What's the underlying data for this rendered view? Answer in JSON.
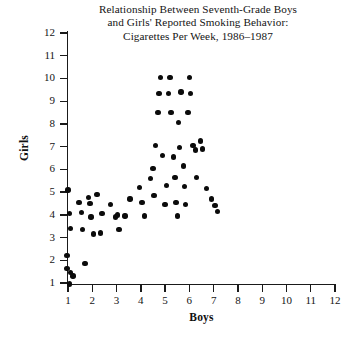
{
  "chart_data": {
    "type": "scatter",
    "title": "Relationship Between Seventh-Grade Boys and Girls' Reported Smoking Behavior: Cigarettes Per Week, 1986–1987",
    "title_lines": [
      "Relationship Between Seventh-Grade Boys",
      "and Girls' Reported Smoking Behavior:",
      "Cigarettes Per Week, 1986–1987"
    ],
    "xlabel": "Boys",
    "ylabel": "Girls",
    "xlim": [
      0.55,
      12.0
    ],
    "ylim": [
      0.45,
      12.0
    ],
    "xticks": [
      1,
      2,
      3,
      4,
      5,
      6,
      7,
      8,
      9,
      10,
      11,
      12
    ],
    "yticks": [
      1,
      2,
      3,
      4,
      5,
      6,
      7,
      8,
      9,
      10,
      11,
      12
    ],
    "xtick_labels": [
      "1",
      "2",
      "3",
      "4",
      "5",
      "6",
      "7",
      "8",
      "9",
      "10",
      "11",
      "12"
    ],
    "ytick_labels": [
      "1",
      "2",
      "3",
      "4",
      "5",
      "6",
      "7",
      "8",
      "9",
      "10",
      "11",
      "12"
    ],
    "grid": false,
    "legend": null,
    "marker": "filled-circle",
    "marker_color": "#0b0b0b",
    "n_points": 63,
    "points": [
      [
        1.0,
        5.1
      ],
      [
        1.05,
        4.05
      ],
      [
        1.1,
        3.4
      ],
      [
        0.95,
        2.2
      ],
      [
        0.95,
        1.65
      ],
      [
        1.1,
        1.45
      ],
      [
        1.2,
        1.3
      ],
      [
        1.05,
        0.95
      ],
      [
        1.45,
        4.55
      ],
      [
        1.55,
        4.1
      ],
      [
        1.6,
        3.35
      ],
      [
        1.7,
        1.85
      ],
      [
        1.85,
        4.75
      ],
      [
        1.9,
        4.5
      ],
      [
        1.95,
        3.9
      ],
      [
        2.05,
        3.15
      ],
      [
        2.2,
        4.9
      ],
      [
        2.35,
        3.2
      ],
      [
        2.4,
        4.05
      ],
      [
        2.75,
        4.45
      ],
      [
        2.95,
        3.9
      ],
      [
        3.05,
        4.0
      ],
      [
        3.1,
        3.35
      ],
      [
        3.35,
        3.95
      ],
      [
        3.55,
        4.7
      ],
      [
        3.95,
        5.2
      ],
      [
        4.05,
        4.55
      ],
      [
        4.15,
        3.95
      ],
      [
        4.4,
        5.6
      ],
      [
        4.5,
        6.05
      ],
      [
        4.55,
        4.85
      ],
      [
        4.6,
        7.05
      ],
      [
        4.7,
        8.5
      ],
      [
        4.75,
        9.35
      ],
      [
        4.8,
        10.05
      ],
      [
        4.9,
        6.6
      ],
      [
        5.0,
        4.45
      ],
      [
        5.05,
        5.3
      ],
      [
        5.15,
        9.35
      ],
      [
        5.2,
        10.05
      ],
      [
        5.25,
        8.5
      ],
      [
        5.35,
        6.55
      ],
      [
        5.4,
        5.65
      ],
      [
        5.45,
        4.55
      ],
      [
        5.5,
        3.95
      ],
      [
        5.55,
        8.05
      ],
      [
        5.6,
        6.95
      ],
      [
        5.65,
        9.4
      ],
      [
        5.75,
        6.15
      ],
      [
        5.8,
        5.25
      ],
      [
        5.85,
        4.45
      ],
      [
        5.95,
        8.5
      ],
      [
        6.0,
        10.05
      ],
      [
        6.05,
        9.35
      ],
      [
        6.15,
        7.05
      ],
      [
        6.25,
        6.85
      ],
      [
        6.3,
        5.65
      ],
      [
        6.45,
        7.25
      ],
      [
        6.55,
        6.9
      ],
      [
        6.7,
        5.15
      ],
      [
        6.9,
        4.7
      ],
      [
        7.05,
        4.4
      ],
      [
        7.15,
        4.15
      ]
    ]
  }
}
